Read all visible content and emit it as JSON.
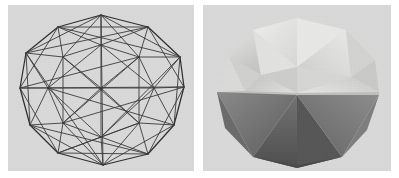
{
  "figure": {
    "title": "",
    "caption": "",
    "background_color": "#ffffff",
    "panel_background_color": "#d9d9d9"
  },
  "panels": [
    {
      "id": "wireframe",
      "label": "wireframe polyhedron",
      "render_mode": "wireframe",
      "edge_color": "#3a3a3a",
      "background_color": "#d9d9d9",
      "geometry": {
        "silhouette": "nonagonal",
        "center": [
          93,
          83
        ],
        "outline_vertices": [
          [
            93,
            10
          ],
          [
            140,
            22
          ],
          [
            172,
            52
          ],
          [
            176,
            82
          ],
          [
            166,
            120
          ],
          [
            140,
            149
          ],
          [
            95,
            160
          ],
          [
            50,
            148
          ],
          [
            22,
            120
          ],
          [
            12,
            83
          ],
          [
            18,
            48
          ],
          [
            50,
            22
          ]
        ],
        "inner_ring_vertices": [
          [
            93,
            40
          ],
          [
            131,
            52
          ],
          [
            146,
            83
          ],
          [
            131,
            118
          ],
          [
            93,
            132
          ],
          [
            55,
            118
          ],
          [
            40,
            83
          ],
          [
            55,
            52
          ]
        ],
        "hub_vertices": [
          [
            93,
            83
          ]
        ]
      }
    },
    {
      "id": "shaded",
      "label": "shaded solid polyhedron",
      "render_mode": "flat-shaded-solid",
      "background_color": "#d9d9d9",
      "face_colors": {
        "top_highlight": "#e9e9e7",
        "top_light": "#dedede",
        "top_mid": "#cfcfcf",
        "upper_left_soft": "#d4d4d4",
        "equator_light": "#bdbdbd",
        "lower_left_dark": "#6e6e6e",
        "lower_mid_dark": "#5f5f5f",
        "lower_right_dark": "#7b7b7b",
        "bottom_darkest": "#4a4a4a",
        "rim_shadow": "#9a9a9a"
      },
      "geometry": {
        "silhouette": "nonagonal",
        "center": [
          94,
          83
        ],
        "outline_vertices": [
          [
            94,
            12
          ],
          [
            142,
            24
          ],
          [
            172,
            54
          ],
          [
            176,
            86
          ],
          [
            164,
            124
          ],
          [
            138,
            152
          ],
          [
            94,
            162
          ],
          [
            50,
            150
          ],
          [
            22,
            122
          ],
          [
            13,
            86
          ],
          [
            18,
            50
          ],
          [
            50,
            24
          ]
        ]
      }
    }
  ]
}
